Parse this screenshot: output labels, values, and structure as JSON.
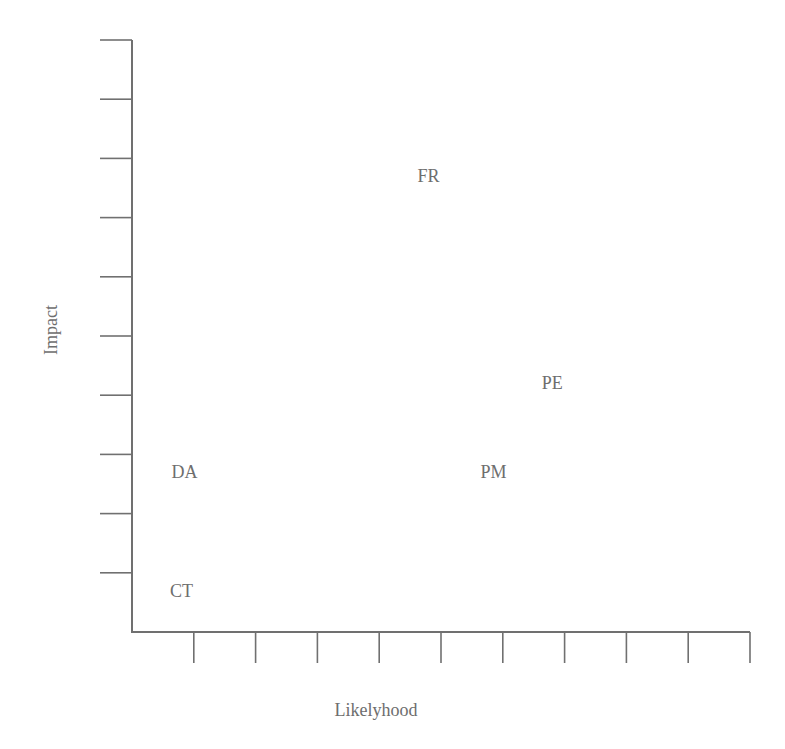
{
  "chart_data": {
    "type": "scatter",
    "title": "",
    "xlabel": "Likelyhood",
    "ylabel": "Impact",
    "xlim": [
      0,
      10
    ],
    "ylim": [
      0,
      10
    ],
    "grid": false,
    "legend": null,
    "x_ticks": 10,
    "y_ticks": 10,
    "tick_labels_shown": false,
    "points": [
      {
        "label": "FR",
        "x": 4.8,
        "y": 7.7
      },
      {
        "label": "PE",
        "x": 6.8,
        "y": 4.2
      },
      {
        "label": "PM",
        "x": 5.85,
        "y": 2.7
      },
      {
        "label": "DA",
        "x": 0.85,
        "y": 2.7
      },
      {
        "label": "CT",
        "x": 0.8,
        "y": 0.7
      }
    ]
  },
  "colors": {
    "axis": "#707070",
    "text": "#6e6e6e",
    "background": "#ffffff"
  }
}
